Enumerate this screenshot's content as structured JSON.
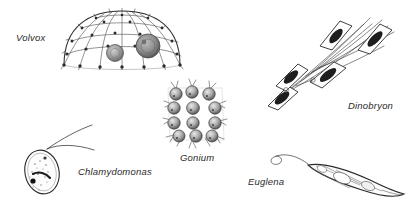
{
  "figure": {
    "type": "scientific-line-drawing",
    "background_color": "#ffffff",
    "ink_color": "#2b2b2b",
    "width": 410,
    "height": 209
  },
  "organisms": [
    {
      "id": "volvox",
      "label": "Volvox",
      "label_x": 16,
      "label_y": 32,
      "description": "hemispherical colony with triangulated cell network, marginal spines and two daughter colonies inside",
      "cell_count_visible": 16,
      "daughter_colonies": 2
    },
    {
      "id": "chlamydomonas",
      "label": "Chlamydomonas",
      "label_x": 78,
      "label_y": 166,
      "description": "single ovoid cell with granular cytoplasm, dark eyespot and two long anterior flagella",
      "flagella": 2
    },
    {
      "id": "gonium",
      "label": "Gonium",
      "label_x": 180,
      "label_y": 152,
      "description": "flat square plate colony of sixteen spherical cells, each bearing two flagella directed outward",
      "cell_count_visible": 16,
      "grid": "4x4"
    },
    {
      "id": "dinobryon",
      "label": "Dinobryon",
      "label_x": 348,
      "label_y": 100,
      "description": "branched dendroid colony of vase-shaped loricas, each containing one dark cell with long flagella",
      "lorica_count_visible": 5
    },
    {
      "id": "euglena",
      "label": "Euglena",
      "label_x": 248,
      "label_y": 176,
      "description": "elongate spindle-shaped cell with pellicle striations and a single long anterior flagellum",
      "flagella": 1
    }
  ]
}
